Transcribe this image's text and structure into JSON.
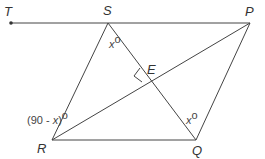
{
  "points": {
    "T": {
      "label": "T",
      "x": 11,
      "y": 23
    },
    "S": {
      "label": "S",
      "x": 108,
      "y": 23
    },
    "P": {
      "label": "P",
      "x": 250,
      "y": 23
    },
    "R": {
      "label": "R",
      "x": 52,
      "y": 140
    },
    "Q": {
      "label": "Q",
      "x": 196,
      "y": 140
    },
    "E": {
      "label": "E",
      "x": 152,
      "y": 80
    }
  },
  "angles": {
    "S": {
      "var": "x",
      "deg": "o"
    },
    "Q": {
      "var": "x",
      "deg": "o"
    },
    "R": {
      "open": "(90 - ",
      "var": "x",
      "close": ")",
      "deg": "o"
    }
  },
  "segments": [
    "TP",
    "SR",
    "SQ",
    "RQ",
    "QP",
    "RP"
  ],
  "colors": {
    "line": "#444444",
    "text": "#333333",
    "background": "#ffffff"
  }
}
